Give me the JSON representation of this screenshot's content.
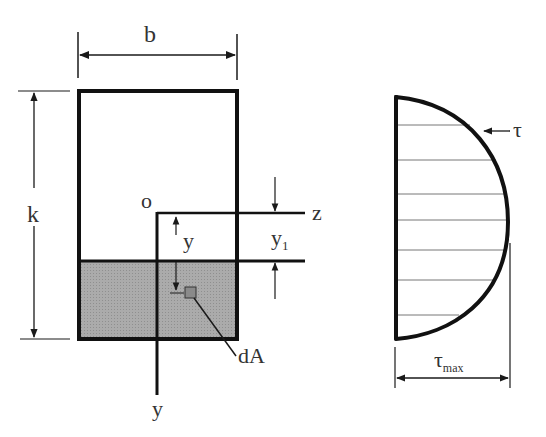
{
  "diagram": {
    "cross_section": {
      "width_label": "b",
      "height_label": "k",
      "origin_label": "o",
      "z_axis_label": "z",
      "y_axis_label": "y",
      "distance_label": "y",
      "y1_label": "y",
      "y1_subscript": "1",
      "element_label": "dA",
      "shaded_fill": "#a8a8a8"
    },
    "stress_profile": {
      "shape": "parabolic",
      "stress_label": "τ",
      "max_label": "τ",
      "max_subscript": "max"
    },
    "colors": {
      "line": "#1a1a1a",
      "thin_line": "#555555",
      "text": "#333333",
      "shade": "#a8a8a8"
    }
  }
}
